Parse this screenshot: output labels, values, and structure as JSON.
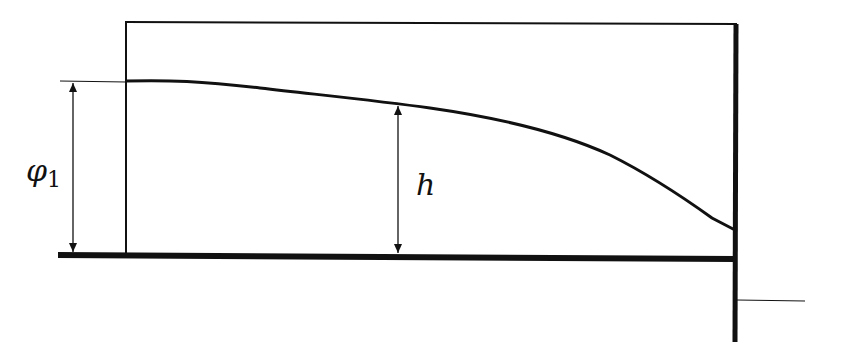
{
  "diagram": {
    "type": "free-surface seepage / aquifer profile",
    "stroke_color": "#111111",
    "background": "#ffffff",
    "labels": {
      "phi_symbol": "φ",
      "phi_subscript": "1",
      "h": "h"
    },
    "elements": [
      {
        "name": "top-boundary",
        "kind": "line"
      },
      {
        "name": "left-wall",
        "kind": "line"
      },
      {
        "name": "right-wall",
        "kind": "thick line"
      },
      {
        "name": "impermeable-base",
        "kind": "thick line"
      },
      {
        "name": "free-surface-curve",
        "kind": "curve"
      },
      {
        "name": "phi1-dimension-arrow",
        "kind": "double arrow",
        "label": "φ1"
      },
      {
        "name": "h-dimension-arrow",
        "kind": "double arrow",
        "label": "h"
      },
      {
        "name": "tailwater-level-line",
        "kind": "line"
      }
    ]
  }
}
